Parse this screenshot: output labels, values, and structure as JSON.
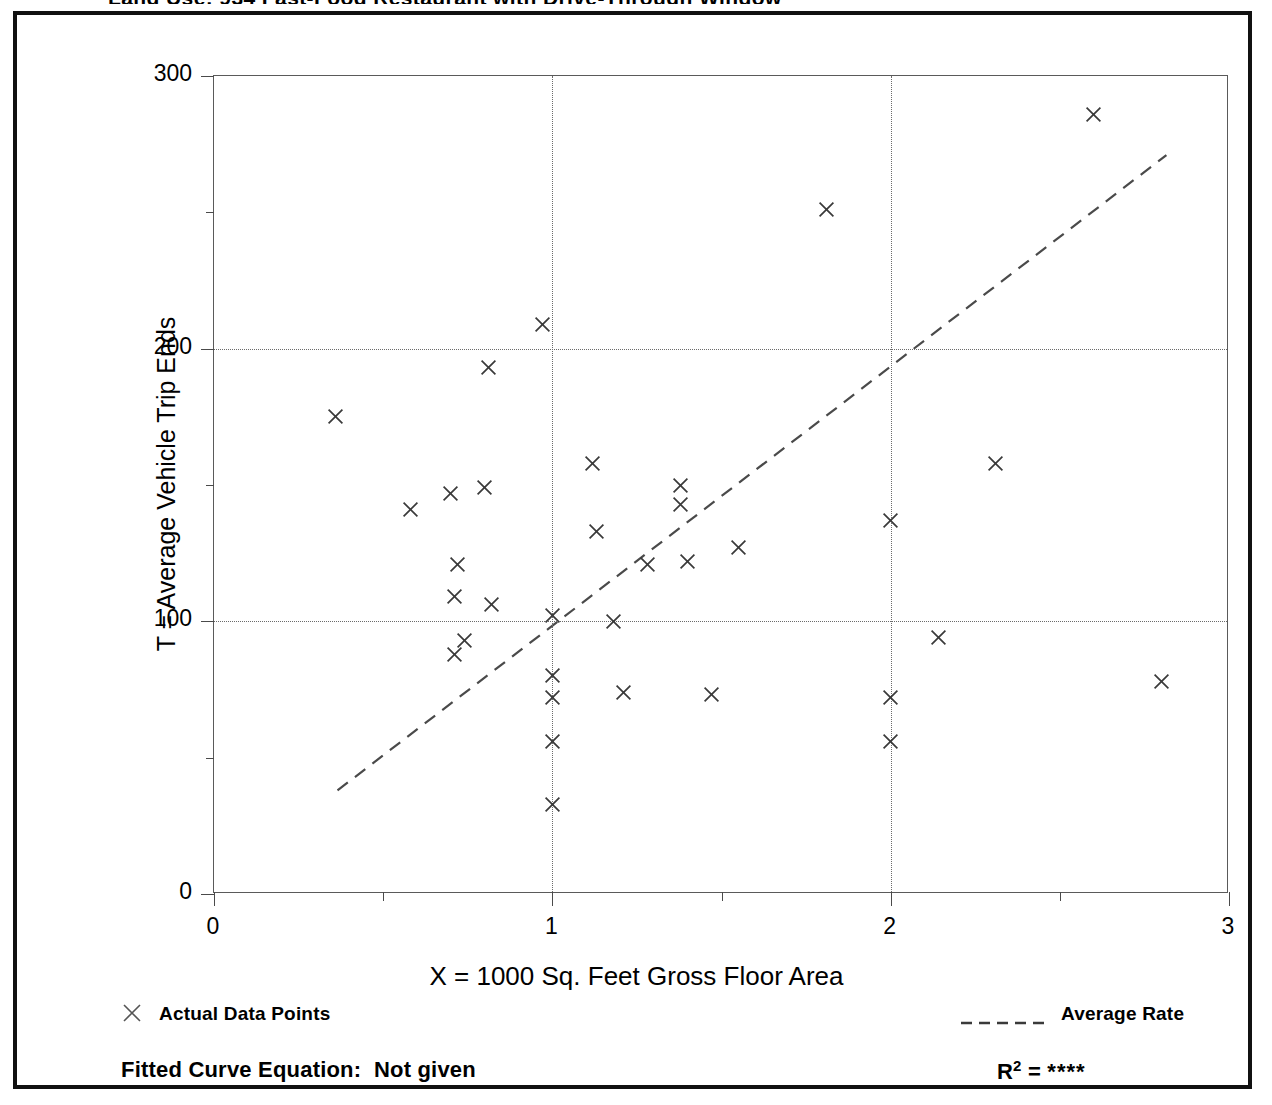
{
  "page": {
    "clipped_header": "Land Use: 934 Fast-Food Restaurant with Drive-Through Window"
  },
  "chart_data": {
    "type": "scatter",
    "title": "",
    "xlabel": "X = 1000 Sq. Feet Gross Floor Area",
    "ylabel": "T = Average Vehicle Trip Ends",
    "xlim": [
      0,
      3
    ],
    "ylim": [
      0,
      300
    ],
    "xticks": [
      "0",
      "1",
      "2",
      "3"
    ],
    "xtick_values": [
      0,
      1,
      2,
      3
    ],
    "xminor_values": [
      0.5,
      1.5,
      2.5
    ],
    "yticks": [
      "0",
      "100",
      "200",
      "300"
    ],
    "ytick_values": [
      0,
      100,
      200,
      300
    ],
    "yminor_values": [
      50,
      150,
      250
    ],
    "grid": "dotted gridlines at y=100, y=200 and x=1, x=2",
    "grid_x": [
      1,
      2
    ],
    "grid_y": [
      100,
      200
    ],
    "legend_position": "below-axes",
    "marker": "x",
    "series": [
      {
        "name": "Actual Data Points",
        "type": "scatter",
        "points": [
          [
            0.36,
            175
          ],
          [
            0.58,
            141
          ],
          [
            0.7,
            147
          ],
          [
            0.72,
            121
          ],
          [
            0.71,
            109
          ],
          [
            0.71,
            88
          ],
          [
            0.74,
            93
          ],
          [
            0.8,
            149
          ],
          [
            0.81,
            193
          ],
          [
            0.82,
            106
          ],
          [
            0.97,
            209
          ],
          [
            1.0,
            102
          ],
          [
            1.0,
            80
          ],
          [
            1.0,
            72
          ],
          [
            1.0,
            56
          ],
          [
            1.0,
            33
          ],
          [
            1.12,
            158
          ],
          [
            1.13,
            133
          ],
          [
            1.18,
            100
          ],
          [
            1.21,
            74
          ],
          [
            1.28,
            121
          ],
          [
            1.38,
            150
          ],
          [
            1.38,
            143
          ],
          [
            1.4,
            122
          ],
          [
            1.47,
            73
          ],
          [
            1.55,
            127
          ],
          [
            1.81,
            251
          ],
          [
            2.0,
            137
          ],
          [
            2.0,
            72
          ],
          [
            2.0,
            56
          ],
          [
            2.14,
            94
          ],
          [
            2.31,
            158
          ],
          [
            2.6,
            286
          ],
          [
            2.8,
            78
          ]
        ]
      },
      {
        "name": "Average Rate",
        "type": "line",
        "style": "dashed",
        "endpoints": [
          [
            0.365,
            38
          ],
          [
            2.815,
            271
          ]
        ]
      }
    ]
  },
  "legend": {
    "left": {
      "marker": "x-marker-icon",
      "label": "Actual Data Points"
    },
    "right": {
      "marker": "dashed-line-icon",
      "label": "Average Rate"
    }
  },
  "footer": {
    "equation_label": "Fitted Curve Equation:",
    "equation_value": "Not given",
    "r2_label": "R",
    "r2_exponent": "2",
    "r2_equals": "=",
    "r2_value": "****"
  },
  "colors": {
    "frame": "#111111",
    "axis": "#4a4a4a",
    "grid": "#6b6b6b",
    "marker": "#3a3a3a",
    "trend": "#4a4a4a",
    "background": "#ffffff"
  }
}
